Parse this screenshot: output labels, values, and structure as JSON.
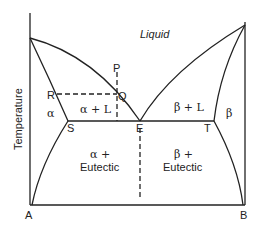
{
  "diagram": {
    "type": "binary eutectic phase diagram",
    "axis": {
      "ylabel": "Temperature",
      "left_component": "A",
      "right_component": "B"
    },
    "regions": {
      "liquid": "Liquid",
      "alpha_plus_liquid": "α + L",
      "beta_plus_liquid": "β + L",
      "alpha": "α",
      "beta": "β",
      "alpha_eutectic_line1": "α +",
      "alpha_eutectic_line2": "Eutectic",
      "beta_eutectic_line1": "β +",
      "beta_eutectic_line2": "Eutectic"
    },
    "points": {
      "P": "P",
      "Q": "Q",
      "R": "R",
      "S": "S",
      "E": "E",
      "T": "T"
    },
    "colors": {
      "line": "#222222",
      "background": "#ffffff"
    }
  }
}
